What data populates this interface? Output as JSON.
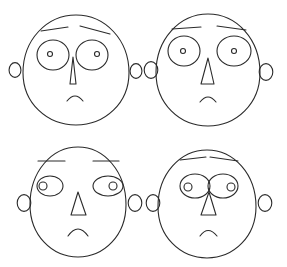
{
  "figure": {
    "type": "chernoff-faces",
    "background": "#ffffff",
    "stroke_color": "#2a2a2a",
    "faces": [
      {
        "id": "face-top-left",
        "head": {
          "cx": 76,
          "cy": 70,
          "rx": 53,
          "ry": 55,
          "top_pointed": true
        },
        "ears": [
          {
            "cx": 15,
            "cy": 70,
            "r": 7
          },
          {
            "cx": 136,
            "cy": 71,
            "r": 7
          }
        ],
        "eyes": [
          {
            "cx": 53,
            "cy": 55,
            "rx": 16,
            "ry": 15
          },
          {
            "cx": 92,
            "cy": 55,
            "rx": 16,
            "ry": 15
          }
        ],
        "pupils": [
          {
            "cx": 50,
            "cy": 54,
            "r": 2.5
          },
          {
            "cx": 97,
            "cy": 54,
            "r": 2.5
          }
        ],
        "brows": [
          {
            "x1": 41,
            "y1": 31,
            "x2": 68,
            "y2": 27
          },
          {
            "x1": 80,
            "y1": 26,
            "x2": 110,
            "y2": 34
          }
        ],
        "nose": {
          "points": "73,57 70,84 76,84"
        },
        "mouth": {
          "d": "M 67 101 Q 75 91 83 101"
        }
      },
      {
        "id": "face-top-right",
        "head": {
          "cx": 208,
          "cy": 70,
          "rx": 52,
          "ry": 56,
          "top_pointed": true
        },
        "ears": [
          {
            "cx": 151,
            "cy": 70,
            "r": 8
          },
          {
            "cx": 266,
            "cy": 72,
            "r": 8
          }
        ],
        "eyes": [
          {
            "cx": 184,
            "cy": 51,
            "rx": 16,
            "ry": 15
          },
          {
            "cx": 234,
            "cy": 51,
            "rx": 17,
            "ry": 15
          }
        ],
        "pupils": [
          {
            "cx": 183,
            "cy": 51,
            "r": 2.5
          },
          {
            "cx": 234,
            "cy": 51,
            "r": 2.5
          }
        ],
        "brows": [
          {
            "x1": 172,
            "y1": 29,
            "x2": 201,
            "y2": 27
          },
          {
            "x1": 217,
            "y1": 26,
            "x2": 246,
            "y2": 30
          }
        ],
        "nose": {
          "points": "208,58 201,84 214,84"
        },
        "mouth": {
          "d": "M 200 102 Q 208 92 216 102"
        }
      },
      {
        "id": "face-bottom-left",
        "head": {
          "cx": 78,
          "cy": 202,
          "rx": 48,
          "ry": 55,
          "top_pointed": true
        },
        "ears": [
          {
            "cx": 24,
            "cy": 203,
            "r": 8
          },
          {
            "cx": 135,
            "cy": 203,
            "r": 8
          }
        ],
        "eyes": [
          {
            "cx": 50,
            "cy": 186,
            "rx": 13,
            "ry": 10
          },
          {
            "cx": 108,
            "cy": 186,
            "rx": 15,
            "ry": 10
          }
        ],
        "pupils": [
          {
            "cx": 43,
            "cy": 186,
            "r": 4
          },
          {
            "cx": 113,
            "cy": 186,
            "r": 4
          }
        ],
        "brows": [
          {
            "x1": 38,
            "y1": 161,
            "x2": 65,
            "y2": 161
          },
          {
            "x1": 93,
            "y1": 161,
            "x2": 119,
            "y2": 161
          }
        ],
        "nose": {
          "points": "78,192 71,215 86,215"
        },
        "mouth": {
          "d": "M 68 236 Q 78 222 88 236"
        }
      },
      {
        "id": "face-bottom-right",
        "head": {
          "cx": 207,
          "cy": 204,
          "rx": 49,
          "ry": 54,
          "top_pointed": true
        },
        "ears": [
          {
            "cx": 153,
            "cy": 203,
            "r": 8
          },
          {
            "cx": 265,
            "cy": 203,
            "r": 8
          }
        ],
        "eyes": [
          {
            "cx": 195,
            "cy": 186,
            "rx": 15,
            "ry": 12
          },
          {
            "cx": 223,
            "cy": 186,
            "rx": 15,
            "ry": 12
          }
        ],
        "pupils": [
          {
            "cx": 188,
            "cy": 187,
            "r": 4
          },
          {
            "cx": 231,
            "cy": 187,
            "r": 4
          }
        ],
        "brows": [
          {
            "x1": 180,
            "y1": 160,
            "x2": 206,
            "y2": 157
          },
          {
            "x1": 210,
            "y1": 157,
            "x2": 238,
            "y2": 161
          }
        ],
        "nose": {
          "points": "209,192 201,215 216,215"
        },
        "mouth": {
          "d": "M 200 236 Q 208 225 217 236"
        }
      }
    ]
  }
}
